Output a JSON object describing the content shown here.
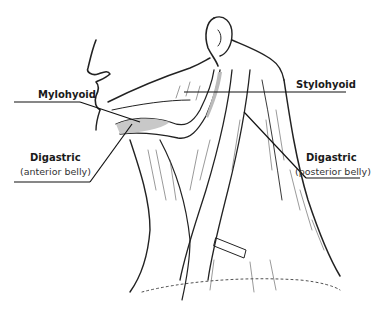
{
  "diagram": {
    "labels": [
      {
        "name": "Mylohyoid",
        "sub": ""
      },
      {
        "name": "Stylohyoid",
        "sub": ""
      },
      {
        "name": "Digastric",
        "sub": "(anterior belly)"
      },
      {
        "name": "Digastric",
        "sub": "(posterior belly)"
      }
    ]
  }
}
